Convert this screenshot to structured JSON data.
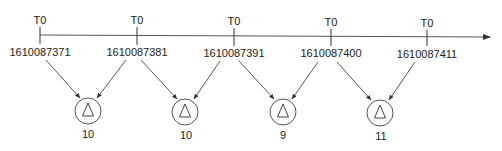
{
  "diagram": {
    "type": "timeline-aggregation",
    "axis": {
      "direction": "right",
      "arrow": true,
      "color": "#333333"
    },
    "ticks": [
      {
        "label": "T0",
        "timestamp": "1610087371"
      },
      {
        "label": "T0",
        "timestamp": "1610087381"
      },
      {
        "label": "T0",
        "timestamp": "1610087391"
      },
      {
        "label": "T0",
        "timestamp": "1610087400"
      },
      {
        "label": "T0",
        "timestamp": "1610087411"
      }
    ],
    "nodes": [
      {
        "symbol": "delta-icon",
        "glyph": "△",
        "value": "10",
        "from_ticks": [
          0,
          1
        ]
      },
      {
        "symbol": "delta-icon",
        "glyph": "△",
        "value": "10",
        "from_ticks": [
          1,
          2
        ]
      },
      {
        "symbol": "delta-icon",
        "glyph": "△",
        "value": "9",
        "from_ticks": [
          2,
          3
        ]
      },
      {
        "symbol": "delta-icon",
        "glyph": "△",
        "value": "11",
        "from_ticks": [
          3,
          4
        ]
      }
    ]
  }
}
